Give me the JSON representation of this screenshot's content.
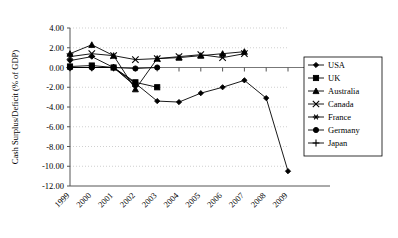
{
  "chart_data": {
    "type": "line",
    "title": "",
    "xlabel": "",
    "ylabel": "Cash Surplus/Deficit (% of GDP)",
    "categories": [
      "1999",
      "2000",
      "2001",
      "2002",
      "2003",
      "2004",
      "2005",
      "2006",
      "2007",
      "2008",
      "2009"
    ],
    "x_tick_labels": [
      "1999",
      "2000",
      "2001",
      "2002",
      "2003",
      "2004",
      "2005",
      "2006",
      "2007",
      "2008",
      "2009"
    ],
    "y_tick_labels": [
      "4.00",
      "2.00",
      "0.00",
      "-2.00",
      "-4.00",
      "-6.00",
      "-8.00",
      "-10.00",
      "-12.00"
    ],
    "y_tick_values": [
      4,
      2,
      0,
      -2,
      -4,
      -6,
      -8,
      -10,
      -12
    ],
    "ylim": [
      -12,
      4
    ],
    "grid": true,
    "legend_position": "right",
    "series": [
      {
        "name": "USA",
        "marker": "diamond",
        "values": [
          0.7,
          1.1,
          0.0,
          -1.6,
          -3.4,
          -3.5,
          -2.6,
          -2.0,
          -1.3,
          -3.1,
          -10.5
        ]
      },
      {
        "name": "UK",
        "marker": "square",
        "values": [
          0.1,
          0.2,
          0.0,
          -1.5,
          -2.0,
          null,
          null,
          null,
          null,
          null,
          null
        ]
      },
      {
        "name": "Australia",
        "marker": "triangle",
        "values": [
          1.4,
          2.3,
          1.2,
          -2.2,
          0.9,
          1.0,
          1.2,
          1.4,
          1.6,
          null,
          null
        ]
      },
      {
        "name": "Canada",
        "marker": "cross-x",
        "values": [
          1.1,
          1.4,
          1.2,
          0.8,
          0.9,
          1.1,
          1.3,
          1.0,
          1.4,
          null,
          null
        ]
      },
      {
        "name": "France",
        "marker": "asterisk",
        "values": [
          0.0,
          0.0,
          0.0,
          -1.8,
          null,
          null,
          null,
          null,
          null,
          null,
          null
        ]
      },
      {
        "name": "Germany",
        "marker": "circle",
        "values": [
          0.0,
          0.0,
          0.0,
          -0.1,
          0.0,
          null,
          null,
          null,
          null,
          null,
          null
        ]
      },
      {
        "name": "Japan",
        "marker": "plus",
        "values": [
          0.0,
          0.0,
          0.0,
          -1.9,
          null,
          null,
          null,
          null,
          null,
          null,
          null
        ]
      }
    ]
  },
  "legend": {
    "entries": [
      {
        "label": "USA",
        "marker": "diamond"
      },
      {
        "label": "UK",
        "marker": "square"
      },
      {
        "label": "Australia",
        "marker": "triangle"
      },
      {
        "label": "Canada",
        "marker": "cross-x"
      },
      {
        "label": "France",
        "marker": "asterisk"
      },
      {
        "label": "Germany",
        "marker": "circle"
      },
      {
        "label": "Japan",
        "marker": "plus"
      }
    ]
  },
  "colors": {
    "series": "#000000",
    "grid": "#bbbbbb",
    "axis": "#555555",
    "background": "#ffffff"
  }
}
